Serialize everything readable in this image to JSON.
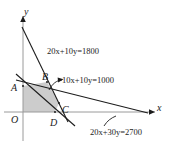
{
  "figure": {
    "background_color": "#ffffff",
    "line_color": "#1c1c1c",
    "shade_color": "#c9c9c9"
  },
  "axes": {
    "x_label": "x",
    "y_label": "y",
    "origin_label": "O"
  },
  "constraints": [
    {
      "id": "line-20x-10y-1800",
      "equation": "20x+10y=1800",
      "a": 20,
      "b": 10,
      "c": 1800,
      "label_text_parts": {
        "t1": "20",
        "v1": "x",
        "t2": "+10",
        "v2": "y",
        "t3": "=1800"
      }
    },
    {
      "id": "line-10x-10y-1000",
      "equation": "10x+10y=1000",
      "a": 10,
      "b": 10,
      "c": 1000,
      "label_text_parts": {
        "t1": "10",
        "v1": "x",
        "t2": "+10",
        "v2": "y",
        "t3": "=1000"
      }
    },
    {
      "id": "line-20x-30y-2700",
      "equation": "20x+30y=2700",
      "a": 20,
      "b": 30,
      "c": 2700,
      "label_text_parts": {
        "t1": "20",
        "v1": "x",
        "t2": "+30",
        "v2": "y",
        "t3": "=2700"
      }
    }
  ],
  "points": [
    {
      "id": "point-a",
      "label": "A"
    },
    {
      "id": "point-b",
      "label": "B"
    },
    {
      "id": "point-c",
      "label": "C"
    },
    {
      "id": "point-d",
      "label": "D"
    },
    {
      "id": "point-o",
      "label": "O"
    }
  ],
  "region": {
    "name": "feasible-region",
    "fill": "#c9c9c9",
    "vertices": [
      "O",
      "A",
      "B",
      "C",
      "D"
    ]
  }
}
